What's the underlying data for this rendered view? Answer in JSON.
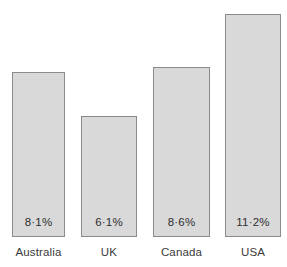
{
  "chart_data": {
    "type": "bar",
    "title": "",
    "subtitle": "",
    "xlabel": "",
    "ylabel": "",
    "ylim": [
      0,
      11.8
    ],
    "grid": false,
    "legend": false,
    "axis_visible": false,
    "value_label_position": "inside-bottom",
    "categories": [
      "Australia",
      "UK",
      "Canada",
      "USA"
    ],
    "values": [
      8.1,
      6.1,
      8.6,
      11.2
    ],
    "value_labels": [
      "8·1%",
      "6·1%",
      "8·6%",
      "11·2%"
    ],
    "series": [
      {
        "name": "",
        "values": [
          8.1,
          6.1,
          8.6,
          11.2
        ]
      }
    ],
    "bars": [
      {
        "category": "Australia",
        "value": 8.1,
        "label": "8·1%"
      },
      {
        "category": "UK",
        "value": 6.1,
        "label": "6·1%"
      },
      {
        "category": "Canada",
        "value": 8.6,
        "label": "8·6%"
      },
      {
        "category": "USA",
        "value": 11.2,
        "label": "11·2%"
      }
    ],
    "colors": {
      "background": "#ffffff",
      "bar_fill": "#d9d9d9",
      "bar_border": "#8b8b8b",
      "value_text": "#2f2f2f",
      "category_text": "#3a3a3a"
    },
    "geometry": {
      "baseline_y": 237,
      "bars": [
        {
          "x": 12,
          "width": 53,
          "top": 72,
          "height": 165
        },
        {
          "x": 81,
          "width": 56,
          "top": 116,
          "height": 121
        },
        {
          "x": 153,
          "width": 57,
          "top": 67,
          "height": 170
        },
        {
          "x": 225,
          "width": 56,
          "top": 14,
          "height": 223
        }
      ]
    }
  }
}
